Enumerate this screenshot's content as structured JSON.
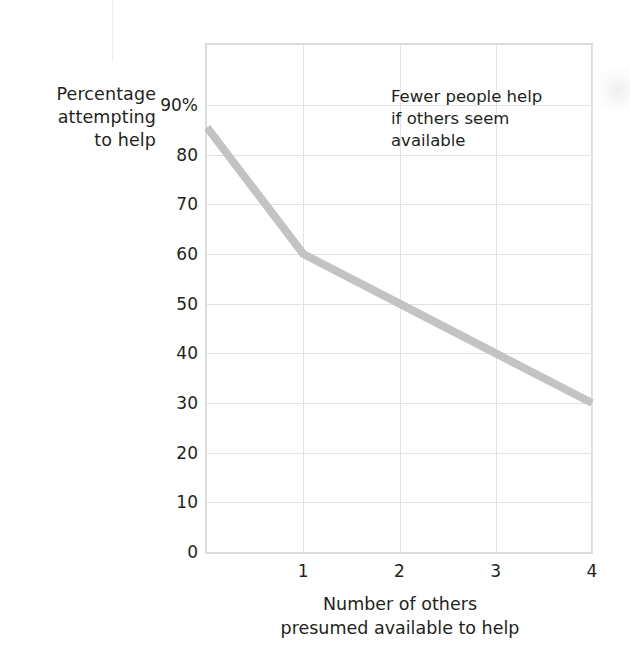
{
  "chart_data": {
    "type": "line",
    "title": "",
    "xlabel": "Number of others presumed available to help",
    "xlabel_lines": [
      "Number of others",
      "presumed available to help"
    ],
    "ylabel": "Percentage attempting to help",
    "ylabel_lines": [
      "Percentage",
      "attempting",
      "to help"
    ],
    "x": [
      0,
      1,
      2,
      3,
      4
    ],
    "values": [
      85.5,
      60,
      50,
      40,
      30
    ],
    "series": [
      {
        "name": "Percentage attempting to help",
        "values": [
          85.5,
          60,
          50,
          40,
          30
        ],
        "color": "#c3c3c3"
      }
    ],
    "xlim": [
      0,
      4
    ],
    "ylim": [
      0,
      100
    ],
    "x_ticks": [
      1,
      2,
      3,
      4
    ],
    "x_tick_labels": [
      "1",
      "2",
      "3",
      "4"
    ],
    "y_ticks": [
      0,
      10,
      20,
      30,
      40,
      50,
      60,
      70,
      80,
      90
    ],
    "y_tick_labels": [
      "0",
      "10",
      "20",
      "30",
      "40",
      "50",
      "60",
      "70",
      "80",
      "90%"
    ],
    "grid": true,
    "legend": "none",
    "annotations": [
      {
        "text": "Fewer people help if others seem available",
        "lines": [
          "Fewer people help",
          "if others seem",
          "available"
        ],
        "x": 2.0,
        "y": 88
      }
    ],
    "colors": {
      "line": "#c3c3c3",
      "grid": "#e3e3e3",
      "frame": "#dcdcdc",
      "text": "#231f20",
      "background": "#ffffff"
    }
  },
  "y_axis": {
    "title_lines": [
      "Percentage",
      "attempting",
      "to help"
    ],
    "tick_labels": [
      "90%",
      "80",
      "70",
      "60",
      "50",
      "40",
      "30",
      "20",
      "10",
      "0"
    ]
  },
  "x_axis": {
    "title_lines": [
      "Number of others",
      "presumed available to help"
    ],
    "tick_labels": [
      "1",
      "2",
      "3",
      "4"
    ]
  },
  "annotation": {
    "line1": "Fewer people help",
    "line2": "if others seem",
    "line3": "available"
  }
}
